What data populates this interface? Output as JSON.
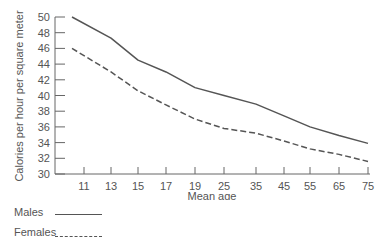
{
  "chart_data": {
    "type": "line",
    "title": "",
    "xlabel": "Mean age",
    "ylabel": "Calories per hour per square meter",
    "x": [
      "11",
      "13",
      "15",
      "17",
      "19",
      "25",
      "35",
      "45",
      "55",
      "65",
      "75"
    ],
    "x_start_label": "",
    "ylim": [
      30,
      50
    ],
    "yticks": [
      30,
      32,
      34,
      36,
      38,
      40,
      42,
      44,
      46,
      48,
      50
    ],
    "grid": false,
    "legend_position": "bottom-left",
    "series": [
      {
        "name": "Males",
        "style": "solid",
        "color": "#555555",
        "start_value": 50,
        "values": [
          47.8,
          47.3,
          44.5,
          43.0,
          41.0,
          40.0,
          38.9,
          37.4,
          36.0,
          34.9,
          33.9
        ]
      },
      {
        "name": "Females",
        "style": "dashed",
        "color": "#555555",
        "start_value": 46,
        "values": [
          44.5,
          43.0,
          40.6,
          38.8,
          37.0,
          35.8,
          35.2,
          34.2,
          33.2,
          32.5,
          31.6
        ]
      }
    ]
  },
  "axes": {
    "xlabel": "Mean age",
    "ylabel": "Calories per hour per square meter"
  },
  "legend": {
    "males_label": "Males",
    "females_label": "Females"
  }
}
